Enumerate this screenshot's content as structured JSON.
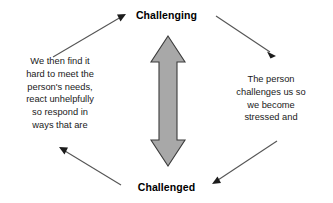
{
  "diagram": {
    "title_top": "Challenging",
    "title_bottom": "Challenged",
    "left_text_lines": [
      "We then find it",
      "hard to meet the",
      "person's needs,",
      "react unhelpfully",
      "so respond in",
      "ways that are"
    ],
    "right_text_lines": [
      "The person",
      "challenges us so",
      "we become",
      "stressed and"
    ],
    "center_arrow": {
      "name": "double-headed-vertical-arrow",
      "fill": "#a8a8a8",
      "stroke": "#3b3b3b"
    },
    "connectors": [
      {
        "name": "arrow-bottom-left-to-top",
        "direction": "up-right"
      },
      {
        "name": "arrow-top-to-bottom-right",
        "direction": "down-right"
      },
      {
        "name": "arrow-bottom-right-to-bottom",
        "direction": "down-left"
      },
      {
        "name": "arrow-bottom-to-top-left",
        "direction": "up-left"
      }
    ],
    "background": "#ffffff",
    "line_color": "#555555"
  }
}
